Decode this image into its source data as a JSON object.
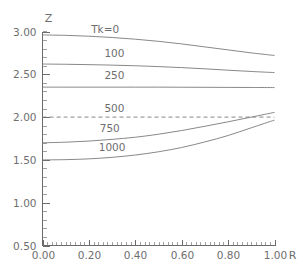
{
  "figure": {
    "faint_title": "",
    "background_color": "#ffffff",
    "line_color": "#7a7a7a",
    "text_color": "#6e6e6e"
  },
  "chart_data": {
    "type": "line",
    "title": "",
    "xlabel": "R",
    "ylabel": "Z",
    "xlim": [
      0.0,
      1.0
    ],
    "ylim": [
      0.5,
      3.0
    ],
    "grid": false,
    "legend_position": "inline-labels",
    "x_ticks": [
      "0.00",
      "0.20",
      "0.40",
      "0.60",
      "0.80",
      "1.00"
    ],
    "x_tick_values": [
      0.0,
      0.2,
      0.4,
      0.6,
      0.8,
      1.0
    ],
    "y_ticks": [
      "0.50",
      "1.00",
      "1.50",
      "2.00",
      "2.50",
      "3.00"
    ],
    "y_tick_values": [
      0.5,
      1.0,
      1.5,
      2.0,
      2.5,
      3.0
    ],
    "x": [
      0.0,
      0.1,
      0.2,
      0.3,
      0.4,
      0.5,
      0.6,
      0.7,
      0.8,
      0.9,
      1.0
    ],
    "series": [
      {
        "name": "Tk=0",
        "label": "Tk=0",
        "style": "solid",
        "label_x": 0.27,
        "label_y": 2.98,
        "values": [
          2.96,
          2.955,
          2.945,
          2.93,
          2.91,
          2.885,
          2.855,
          2.82,
          2.785,
          2.75,
          2.72
        ]
      },
      {
        "name": "100",
        "label": "100",
        "style": "solid",
        "label_x": 0.31,
        "label_y": 2.7,
        "values": [
          2.62,
          2.617,
          2.613,
          2.607,
          2.6,
          2.59,
          2.578,
          2.564,
          2.548,
          2.533,
          2.52
        ]
      },
      {
        "name": "250",
        "label": "250",
        "style": "solid",
        "label_x": 0.31,
        "label_y": 2.44,
        "values": [
          2.35,
          2.35,
          2.35,
          2.35,
          2.35,
          2.35,
          2.349,
          2.348,
          2.347,
          2.346,
          2.345
        ]
      },
      {
        "name": "500",
        "label": "500",
        "style": "dashed",
        "label_x": 0.31,
        "label_y": 2.06,
        "values": [
          2.0,
          2.0,
          2.0,
          2.0,
          2.0,
          2.0,
          2.0,
          2.0,
          2.0,
          2.0,
          2.0
        ]
      },
      {
        "name": "750",
        "label": "750",
        "style": "solid",
        "label_x": 0.29,
        "label_y": 1.83,
        "values": [
          1.7,
          1.707,
          1.72,
          1.74,
          1.765,
          1.8,
          1.843,
          1.893,
          1.945,
          2.0,
          2.055
        ]
      },
      {
        "name": "1000",
        "label": "1000",
        "style": "solid",
        "label_x": 0.3,
        "label_y": 1.6,
        "values": [
          1.5,
          1.503,
          1.512,
          1.53,
          1.557,
          1.595,
          1.645,
          1.71,
          1.785,
          1.875,
          1.965
        ]
      }
    ]
  }
}
